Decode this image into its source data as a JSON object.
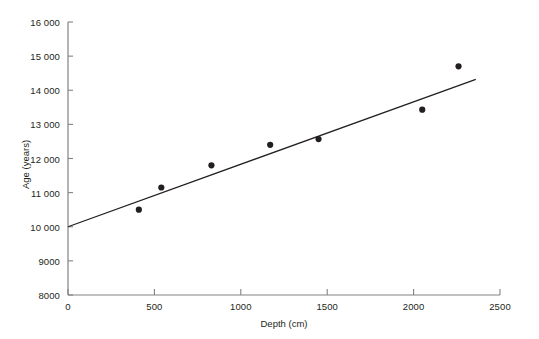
{
  "chart_data": {
    "type": "scatter",
    "title": "",
    "xlabel": "Depth (cm)",
    "ylabel": "Age (years)",
    "xlim": [
      0,
      2500
    ],
    "ylim": [
      8000,
      16000
    ],
    "xticks": [
      "0",
      "500",
      "1000",
      "1500",
      "2000",
      "2500"
    ],
    "xtick_values": [
      0,
      500,
      1000,
      1500,
      2000,
      2500
    ],
    "yticks": [
      "8000",
      "9000",
      "10 000",
      "11 000",
      "12 000",
      "13 000",
      "14 000",
      "15 000",
      "16 000"
    ],
    "ytick_values": [
      8000,
      9000,
      10000,
      11000,
      12000,
      13000,
      14000,
      15000,
      16000
    ],
    "grid": false,
    "legend": false,
    "series": [
      {
        "name": "Radiocarbon samples",
        "type": "scatter",
        "marker": "circle",
        "color": "#231f20",
        "points": [
          {
            "x": 410,
            "y": 10500
          },
          {
            "x": 540,
            "y": 11150
          },
          {
            "x": 830,
            "y": 11800
          },
          {
            "x": 1170,
            "y": 12400
          },
          {
            "x": 1450,
            "y": 12570
          },
          {
            "x": 2050,
            "y": 13430
          },
          {
            "x": 2260,
            "y": 14700
          }
        ]
      },
      {
        "name": "Linear fit",
        "type": "line",
        "color": "#231f20",
        "points": [
          {
            "x": 0,
            "y": 10000
          },
          {
            "x": 2360,
            "y": 14320
          }
        ]
      }
    ]
  },
  "style": {
    "axis_color": "#808285",
    "ink_color": "#231f20",
    "background": "#ffffff"
  }
}
